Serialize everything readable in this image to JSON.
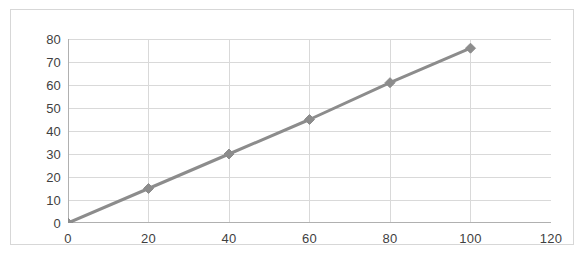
{
  "chart_data": {
    "type": "line",
    "title": "",
    "subtitle": "",
    "xlabel": "",
    "ylabel": "",
    "xlim": [
      0,
      120
    ],
    "ylim": [
      0,
      80
    ],
    "xticks": [
      0,
      20,
      40,
      60,
      80,
      100,
      120
    ],
    "yticks": [
      0,
      10,
      20,
      30,
      40,
      50,
      60,
      70,
      80
    ],
    "xtick_labels": [
      "0",
      "20",
      "40",
      "60",
      "80",
      "100",
      "120"
    ],
    "ytick_labels": [
      "0",
      "10",
      "20",
      "30",
      "40",
      "50",
      "60",
      "70",
      "80"
    ],
    "grid": {
      "horizontal": true,
      "vertical": true,
      "vertical_major_visible_at": [
        20,
        40,
        60,
        80,
        100
      ],
      "color": "#d9d9d9"
    },
    "legend": {
      "visible": false,
      "position": "none",
      "entries": []
    },
    "annotations": [],
    "series": [
      {
        "name": "Series 1",
        "color": "#8c8c8c",
        "marker": "diamond",
        "marker_size": 7,
        "line_width": 3,
        "x": [
          0,
          20,
          40,
          60,
          80,
          100
        ],
        "values": [
          0,
          15,
          30,
          45,
          61,
          76
        ],
        "points": [
          {
            "x": 0,
            "y": 0
          },
          {
            "x": 20,
            "y": 15
          },
          {
            "x": 40,
            "y": 30
          },
          {
            "x": 60,
            "y": 45
          },
          {
            "x": 80,
            "y": 61
          },
          {
            "x": 100,
            "y": 76
          }
        ]
      }
    ],
    "axis_color": "#b0b0b0",
    "plot_background": "#ffffff",
    "frame_color": "#d7d7d7"
  }
}
